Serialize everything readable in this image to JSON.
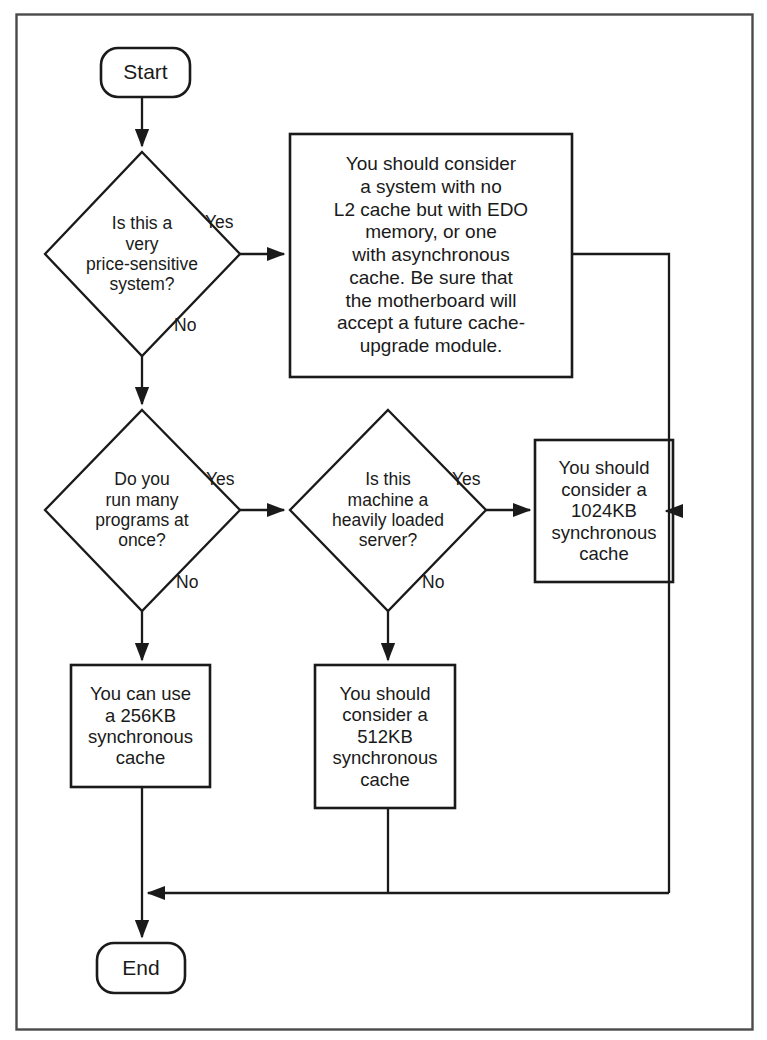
{
  "figure": {
    "kind": "flowchart",
    "border_color": "#4a4a4a",
    "line_color": "#1a1a1a",
    "background": "#ffffff"
  },
  "nodes": {
    "start": {
      "label": "Start",
      "shape": "terminal"
    },
    "end": {
      "label": "End",
      "shape": "terminal"
    },
    "decision_price": {
      "label": "Is this a\nvery\nprice-sensitive\nsystem?",
      "shape": "diamond"
    },
    "decision_programs": {
      "label": "Do you\nrun many\nprograms at\nonce?",
      "shape": "diamond"
    },
    "decision_server": {
      "label": "Is this\nmachine a\nheavily loaded\nserver?",
      "shape": "diamond"
    },
    "advice_no_l2": {
      "label": "You should consider\na system with no\nL2 cache but with EDO\nmemory, or one\nwith asynchronous\ncache.  Be sure that\nthe motherboard will\naccept a future cache-\nupgrade module.",
      "shape": "process"
    },
    "advice_1024": {
      "label": "You should\nconsider a\n1024KB\nsynchronous\ncache",
      "shape": "process"
    },
    "advice_256": {
      "label": "You can use\na 256KB\nsynchronous\ncache",
      "shape": "process"
    },
    "advice_512": {
      "label": "You should\nconsider a\n512KB\nsynchronous\ncache",
      "shape": "process"
    }
  },
  "edge_labels": {
    "price_yes": "Yes",
    "price_no": "No",
    "programs_yes": "Yes",
    "programs_no": "No",
    "server_yes": "Yes",
    "server_no": "No"
  },
  "edges": [
    {
      "from": "start",
      "to": "decision_price",
      "label": ""
    },
    {
      "from": "decision_price",
      "to": "advice_no_l2",
      "label": "Yes"
    },
    {
      "from": "decision_price",
      "to": "decision_programs",
      "label": "No"
    },
    {
      "from": "decision_programs",
      "to": "decision_server",
      "label": "Yes"
    },
    {
      "from": "decision_programs",
      "to": "advice_256",
      "label": "No"
    },
    {
      "from": "decision_server",
      "to": "advice_1024",
      "label": "Yes"
    },
    {
      "from": "decision_server",
      "to": "advice_512",
      "label": "No"
    },
    {
      "from": "advice_no_l2",
      "to": "end",
      "label": ""
    },
    {
      "from": "advice_1024",
      "to": "end",
      "label": ""
    },
    {
      "from": "advice_256",
      "to": "end",
      "label": ""
    },
    {
      "from": "advice_512",
      "to": "end",
      "label": ""
    }
  ]
}
